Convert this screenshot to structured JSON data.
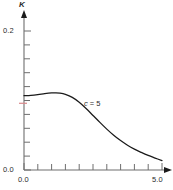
{
  "chart_data": {
    "type": "line",
    "title": "",
    "xlabel": "",
    "ylabel": "K",
    "xlim": [
      0.0,
      5.0
    ],
    "ylim": [
      0.0,
      0.2
    ],
    "grid": false,
    "legend_position": "inline-annotation",
    "x_ticks": [
      0.0,
      0.5,
      1.0,
      1.5,
      2.0,
      2.5,
      3.0,
      3.5,
      4.0,
      4.5,
      5.0
    ],
    "x_tick_labels": [
      "0.0",
      "",
      "",
      "",
      "",
      "",
      "",
      "",
      "",
      "",
      "5.0"
    ],
    "y_ticks": [
      0.0,
      0.02,
      0.04,
      0.06,
      0.08,
      0.1,
      0.12,
      0.14,
      0.16,
      0.18,
      0.2
    ],
    "y_tick_labels": [
      "0.0",
      "",
      "",
      "",
      "",
      "",
      "",
      "",
      "",
      "",
      "0.2"
    ],
    "x_tick_major_label_min": "0.0",
    "x_tick_major_label_max": "5.0",
    "y_tick_major_label_min": "0.0",
    "y_tick_major_label_max": "0.2",
    "annotations": [
      {
        "text": "c = 5",
        "x": 2.4,
        "y": 0.085,
        "italic_var": "c"
      }
    ],
    "series": [
      {
        "name": "c = 5",
        "color": "#1a1a1a",
        "x": [
          0.0,
          0.25,
          0.5,
          0.75,
          1.0,
          1.15,
          1.3,
          1.5,
          1.75,
          2.0,
          2.25,
          2.5,
          2.75,
          3.0,
          3.25,
          3.5,
          3.75,
          4.0,
          4.25,
          4.5,
          4.75,
          5.0
        ],
        "values": [
          0.107,
          0.1075,
          0.1085,
          0.1098,
          0.1108,
          0.111,
          0.1106,
          0.1088,
          0.1045,
          0.0975,
          0.0885,
          0.0785,
          0.0685,
          0.0588,
          0.05,
          0.0423,
          0.0356,
          0.03,
          0.0253,
          0.021,
          0.0172,
          0.0135
        ]
      }
    ],
    "marker_tick": {
      "axis": "y",
      "value": 0.096,
      "color": "#d9888a"
    }
  },
  "axes": {
    "y_axis_label": "K",
    "x_axis_arrow": true,
    "y_axis_arrow": true,
    "axis_color": "#6e6e6e",
    "curve_color": "#1a1a1a"
  }
}
